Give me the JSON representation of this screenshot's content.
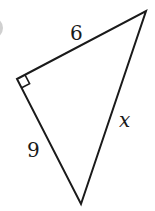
{
  "figure": {
    "type": "right-triangle",
    "labels": {
      "top_side": "6",
      "left_side": "9",
      "hypotenuse": "x"
    },
    "vertices": {
      "right_angle": [
        17,
        79
      ],
      "top": [
        146,
        11
      ],
      "bottom": [
        81,
        204
      ]
    },
    "colors": {
      "stroke": "#1a1a1a",
      "background": "#ffffff",
      "badge": "#c8c8c8"
    }
  }
}
